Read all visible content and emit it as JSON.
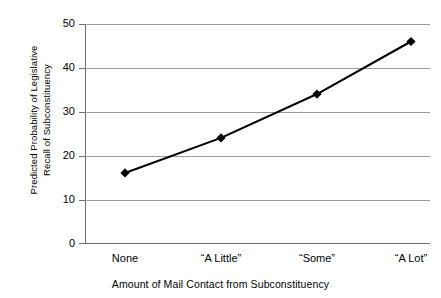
{
  "chart_data": {
    "type": "line",
    "title": "",
    "subtitle": "",
    "xlabel": "Amount of Mail Contact from Subconstituency",
    "ylabel": "Predicted Probability of Legislative Recall of Subconstituency",
    "ylabel_lines": [
      "Predicted Probability of Legislative",
      "Recall of Subconstituency"
    ],
    "categories": [
      "None",
      "“A Little”",
      "“Some”",
      "“A Lot”"
    ],
    "values": [
      16,
      24,
      34,
      46
    ],
    "ylim": [
      0,
      50
    ],
    "yticks": [
      0,
      10,
      20,
      30,
      40,
      50
    ],
    "ytick_labels": [
      "0",
      "10",
      "20",
      "30",
      "40",
      "50"
    ],
    "grid": "horizontal",
    "legend": "none",
    "marker": "diamond",
    "series": [
      {
        "name": "Predicted Probability",
        "values": [
          16,
          24,
          34,
          46
        ],
        "color": "#000000",
        "marker_color": "#000000"
      }
    ],
    "colors": {
      "line": "#000000",
      "marker": "#000000",
      "gridline": "#9a9a9a",
      "axis": "#6e6e6e",
      "background": "#ffffff",
      "text": "#000000"
    }
  }
}
